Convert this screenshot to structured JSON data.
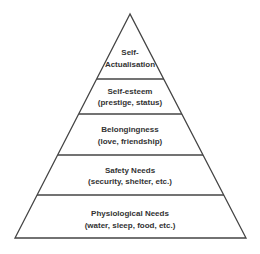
{
  "diagram": {
    "type": "pyramid",
    "colors": {
      "stroke": "#444444",
      "text": "#333333",
      "background": "#ffffff"
    },
    "levels": [
      {
        "title": "Self-",
        "title2": "Actualisation",
        "subtitle": ""
      },
      {
        "title": "Self-esteem",
        "subtitle": "(prestige, status)"
      },
      {
        "title": "Belongingness",
        "subtitle": "(love, friendship)"
      },
      {
        "title": "Safety Needs",
        "subtitle": "(security, shelter, etc.)"
      },
      {
        "title": "Physiological Needs",
        "subtitle": "(water, sleep, food, etc.)"
      }
    ]
  }
}
